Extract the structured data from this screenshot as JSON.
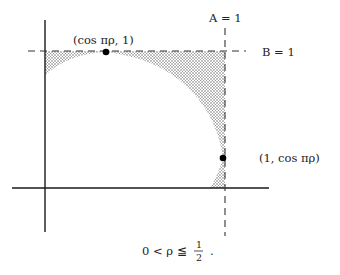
{
  "diagram": {
    "labels": {
      "point_top": "(cos πρ, 1)",
      "point_right": "(1, cos πρ)",
      "line_a": "A = 1",
      "line_b": "B = 1",
      "condition": "0 < ρ ≦ ",
      "fraction_num": "1",
      "fraction_den": "2",
      "condition_end": "."
    },
    "colors": {
      "axis": "#1a1a1a",
      "dash": "#333333",
      "shade_dot": "#555555",
      "point": "#000000"
    }
  }
}
